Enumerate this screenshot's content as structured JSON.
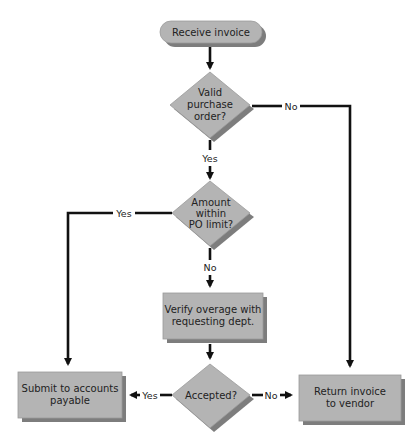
{
  "diagram": {
    "type": "flowchart",
    "colors": {
      "shape_fill": "#b4b4b4",
      "shape_shadow": "#7d7d7d",
      "shape_border": "#9a9a9a",
      "line": "#111111",
      "background": "#ffffff"
    },
    "nodes": [
      {
        "id": "start",
        "shape": "terminator",
        "lines": [
          "Receive invoice"
        ]
      },
      {
        "id": "valid_po",
        "shape": "decision",
        "lines": [
          "Valid",
          "purchase",
          "order?"
        ]
      },
      {
        "id": "within_limit",
        "shape": "decision",
        "lines": [
          "Amount",
          "within",
          "PO limit?"
        ]
      },
      {
        "id": "verify",
        "shape": "process",
        "lines": [
          "Verify overage with",
          "requesting dept."
        ]
      },
      {
        "id": "accepted",
        "shape": "decision",
        "lines": [
          "Accepted?"
        ]
      },
      {
        "id": "submit",
        "shape": "process",
        "lines": [
          "Submit to accounts",
          "payable"
        ]
      },
      {
        "id": "return",
        "shape": "process",
        "lines": [
          "Return invoice",
          "to vendor"
        ]
      }
    ],
    "edges": [
      {
        "from": "start",
        "to": "valid_po",
        "label": ""
      },
      {
        "from": "valid_po",
        "to": "within_limit",
        "label": "Yes"
      },
      {
        "from": "valid_po",
        "to": "return",
        "label": "No"
      },
      {
        "from": "within_limit",
        "to": "submit",
        "label": "Yes"
      },
      {
        "from": "within_limit",
        "to": "verify",
        "label": "No"
      },
      {
        "from": "verify",
        "to": "accepted",
        "label": ""
      },
      {
        "from": "accepted",
        "to": "submit",
        "label": "Yes"
      },
      {
        "from": "accepted",
        "to": "return",
        "label": "No"
      }
    ]
  }
}
